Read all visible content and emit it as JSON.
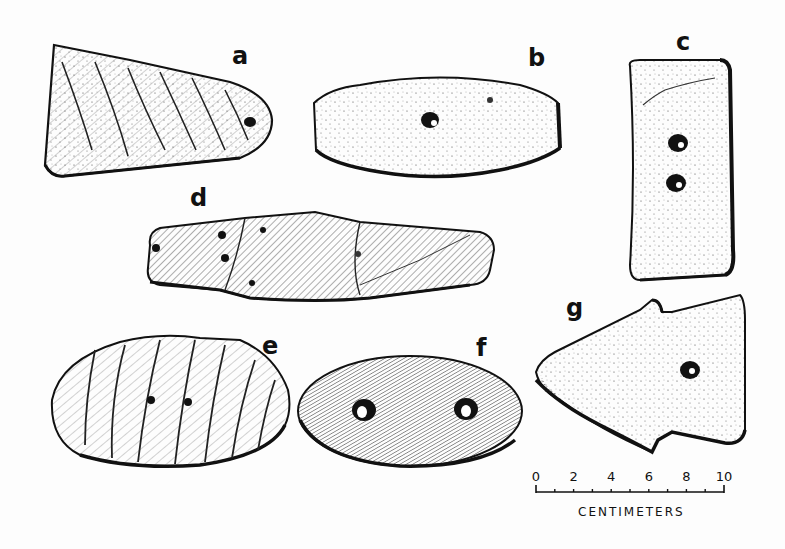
{
  "figure": {
    "type": "archaeological illustration plate",
    "artifacts": [
      {
        "label": "a",
        "shape": "trapezoidal tablet with rounded end",
        "perforations": 1,
        "surface": "diagonal grooves"
      },
      {
        "label": "b",
        "shape": "elongated lens / boat shape",
        "perforations": 1,
        "surface": "stippled"
      },
      {
        "label": "c",
        "shape": "rectangular bar",
        "perforations": 2,
        "surface": "stippled, crack line"
      },
      {
        "label": "d",
        "shape": "long bar, broken into three joined pieces",
        "perforations": 5,
        "surface": "hatched"
      },
      {
        "label": "e",
        "shape": "oval with diagonal grooves",
        "perforations": 2,
        "surface": "grooved"
      },
      {
        "label": "f",
        "shape": "elliptical disc",
        "perforations": 2,
        "surface": "densely hatched"
      },
      {
        "label": "g",
        "shape": "notched triangular (arrow) form",
        "perforations": 1,
        "surface": "stippled"
      }
    ]
  },
  "scale_bar": {
    "ticks": [
      "0",
      "2",
      "4",
      "6",
      "8",
      "10"
    ],
    "minor_ticks": 11,
    "unit": "CENTIMETERS"
  },
  "colors": {
    "ink": "#111111",
    "paper": "#fdfdfd"
  }
}
